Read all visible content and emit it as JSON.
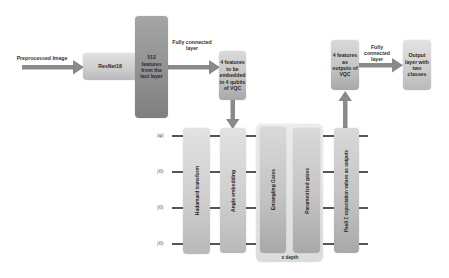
{
  "diagram": {
    "input_label": "Preprocessed Image",
    "resnet_label": "ResNet18",
    "features_512_label": "512 features from the last layer",
    "fc1_label": "Fully connected layer",
    "embed_box_label": "4 features to be embedded in 4 qubits of VQC",
    "vqc_output_label": "4 features as outputs of VQC",
    "fc2_label": "Fully connected layer",
    "output_label": "Output layer with two classes",
    "circuit": {
      "kets": [
        "|ψ⟩",
        "|0⟩",
        "|0⟩",
        "|0⟩"
      ],
      "hadamard_label": "Hadamard transform",
      "angle_embedding_label": "Angle embedding",
      "entangling_label": "Entangling Gates",
      "parametrized_label": "Parametrized gates",
      "pauli_label": "Pauli Z expectation values as outputs",
      "depth_label": "x depth"
    },
    "colors": {
      "arrow": "#8a8a8a",
      "box_light": "#cdcdcd",
      "box_dark": "#8f8f8f",
      "wire": "#555555"
    }
  }
}
